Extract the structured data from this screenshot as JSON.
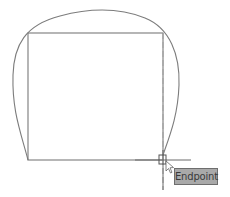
{
  "drawing": {
    "stroke_color": "#7a7a7a",
    "tracking_color": "#9a9a9a",
    "rectangle": {
      "x": 28,
      "y": 33,
      "width": 135,
      "height": 127
    },
    "cursor": {
      "x": 163,
      "y": 160
    }
  },
  "snap": {
    "tooltip_label": "Endpoint",
    "marker": "endpoint-square-marker"
  }
}
